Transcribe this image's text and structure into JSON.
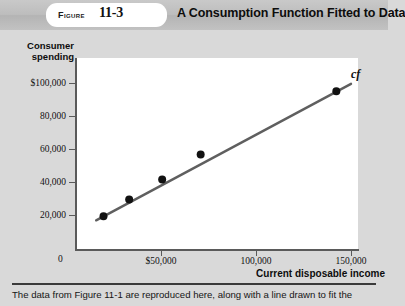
{
  "header": {
    "figure_word": "Figure",
    "figure_number": "11-3",
    "title": "A Consumption Function Fitted to Data"
  },
  "caption": "The data from Figure 11-1 are reproduced here, along with a line drawn to fit the",
  "colors": {
    "background": "#d9d9d9",
    "plot_background": "#ffffff",
    "axis": "#5a5a5a",
    "line": "#5f5f5f",
    "point": "#111111",
    "header_band": "#bdbdbd"
  },
  "chart_data": {
    "type": "scatter",
    "title": "A Consumption Function Fitted to Data",
    "xlabel": "Current disposable income",
    "ylabel": "Consumer spending",
    "xlim": [
      0,
      165000
    ],
    "ylim": [
      0,
      115000
    ],
    "grid": false,
    "legend": "none",
    "annotations": [
      {
        "text": "cf",
        "x": 152000,
        "y": 103000,
        "style": "italic"
      }
    ],
    "xticks": [
      0,
      50000,
      100000,
      150000
    ],
    "xtick_labels": [
      "0",
      "$50,000",
      "100,000",
      "150,000"
    ],
    "yticks": [
      0,
      20000,
      40000,
      60000,
      80000,
      100000
    ],
    "ytick_labels": [
      "0",
      "20,000",
      "40,000",
      "60,000",
      "80,000",
      "$100,000"
    ],
    "x": [
      15000,
      29000,
      47000,
      68000,
      142000
    ],
    "y": [
      20000,
      30000,
      42000,
      57000,
      95000
    ],
    "series": [
      {
        "name": "Household data points",
        "type": "scatter",
        "points": [
          {
            "x": 15000,
            "y": 20000
          },
          {
            "x": 29000,
            "y": 30000
          },
          {
            "x": 47000,
            "y": 42000
          },
          {
            "x": 68000,
            "y": 57000
          },
          {
            "x": 142000,
            "y": 95000
          }
        ]
      },
      {
        "name": "cf",
        "type": "line",
        "points": [
          {
            "x": 11000,
            "y": 17500
          },
          {
            "x": 150000,
            "y": 99500
          }
        ]
      }
    ]
  }
}
